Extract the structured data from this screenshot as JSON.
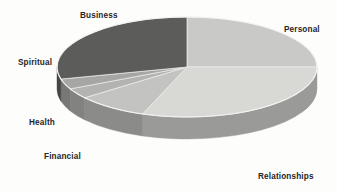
{
  "chart_data": {
    "type": "pie",
    "title": "",
    "subtitle": "",
    "xlabel": "",
    "ylabel": "",
    "grid": false,
    "legend_position": "none",
    "style": "3d-exploded-disc",
    "labels_inline": true,
    "categories": [
      "Personal",
      "Relationships",
      "Financial",
      "Health",
      "Spiritual",
      "Business"
    ],
    "values": [
      25,
      30.5,
      9,
      3.5,
      3.5,
      28.5
    ],
    "unit": "percent",
    "series": [
      {
        "name": "Life Areas",
        "values": [
          25,
          30.5,
          9,
          3.5,
          3.5,
          28.5
        ]
      }
    ],
    "slices": [
      {
        "label": "Personal",
        "value": 25,
        "start_angle_deg": 0,
        "end_angle_deg": 90,
        "top_color": "#c9c9c7",
        "side_color": "#8f8f8d"
      },
      {
        "label": "Relationships",
        "value": 30.5,
        "start_angle_deg": 90,
        "end_angle_deg": 200,
        "top_color": "#d8d8d5",
        "side_color": "#9a9a98"
      },
      {
        "label": "Financial",
        "value": 9,
        "start_angle_deg": 200,
        "end_angle_deg": 232,
        "top_color": "#c3c3c1",
        "side_color": "#8b8b89"
      },
      {
        "label": "Health",
        "value": 3.5,
        "start_angle_deg": 232,
        "end_angle_deg": 244,
        "top_color": "#b3b3b1",
        "side_color": "#828280"
      },
      {
        "label": "Spiritual",
        "value": 3.5,
        "start_angle_deg": 244,
        "end_angle_deg": 256,
        "top_color": "#a6a6a4",
        "side_color": "#787876"
      },
      {
        "label": "Business",
        "value": 28.5,
        "start_angle_deg": 256,
        "end_angle_deg": 360,
        "top_color": "#5c5c5a",
        "side_color": "#454543"
      }
    ]
  },
  "labels": {
    "business": "Business",
    "personal": "Personal",
    "spiritual": "Spiritual",
    "health": "Health",
    "financial": "Financial",
    "relationships": "Relationships"
  },
  "colors": {
    "background": "#fdfdfc",
    "label_text": "#262626",
    "darkest_slice": "#5c5c5a",
    "lightest_slice": "#d8d8d5"
  }
}
